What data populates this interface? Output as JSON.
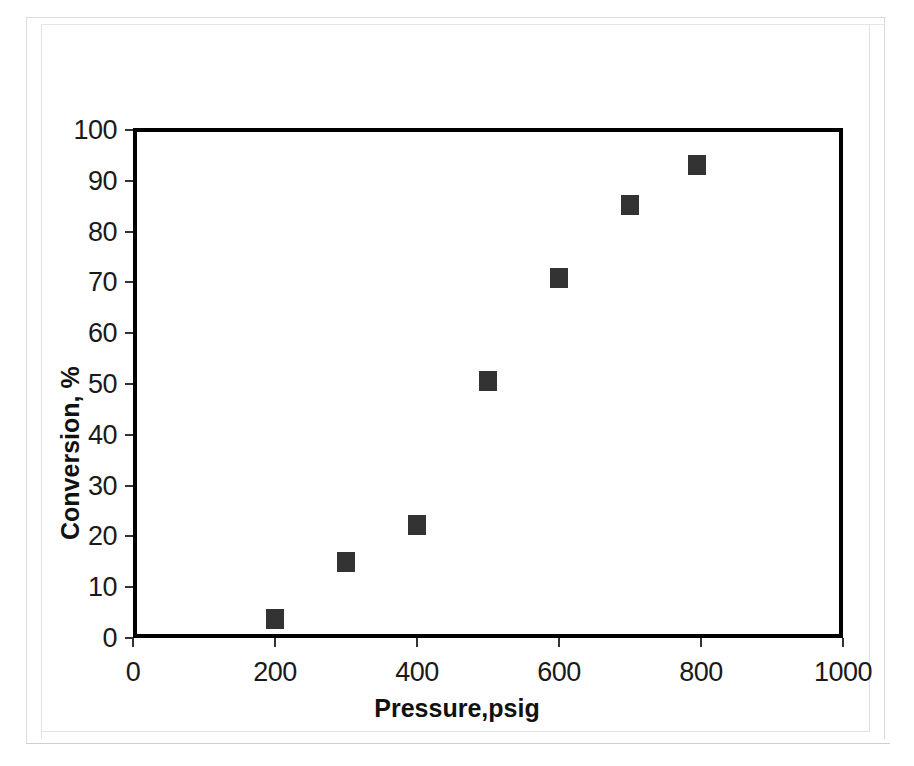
{
  "chart_data": {
    "type": "scatter",
    "title": "",
    "xlabel": "Pressure,psig",
    "ylabel": "Conversion, %",
    "xlim": [
      0,
      1000
    ],
    "ylim": [
      0,
      100
    ],
    "xticks": [
      0,
      200,
      400,
      600,
      800,
      1000
    ],
    "xtick_labels": [
      "0",
      "200",
      "400",
      "600",
      "800",
      "1000"
    ],
    "yticks": [
      0,
      10,
      20,
      30,
      40,
      50,
      60,
      70,
      80,
      90,
      100
    ],
    "ytick_labels": [
      "0",
      "10",
      "20",
      "30",
      "40",
      "50",
      "60",
      "70",
      "80",
      "90",
      "100"
    ],
    "grid": false,
    "legend": null,
    "marker": {
      "shape": "square",
      "color": "#333333",
      "size_px": 18
    },
    "frame": {
      "color": "#000000",
      "width_px": 4,
      "box": true
    },
    "series": [
      {
        "name": "Conversion",
        "points": [
          {
            "x": 200,
            "y": 3.7
          },
          {
            "x": 300,
            "y": 15.0
          },
          {
            "x": 400,
            "y": 22.3
          },
          {
            "x": 500,
            "y": 50.5
          },
          {
            "x": 600,
            "y": 70.8
          },
          {
            "x": 700,
            "y": 85.2
          },
          {
            "x": 795,
            "y": 93.2
          }
        ]
      }
    ]
  },
  "page": {
    "background_color": "#ffffff",
    "border_color": "#dcdcdc"
  }
}
